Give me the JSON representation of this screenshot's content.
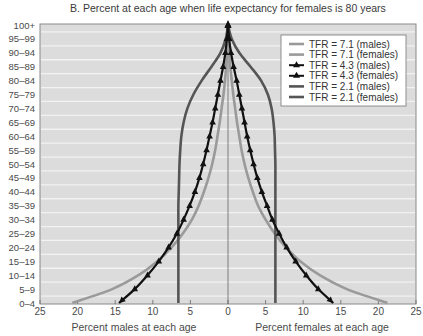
{
  "chart_data": {
    "type": "line",
    "title": "B. Percent at each age when life expectancy for females is 80 years",
    "xlabel_left": "Percent males at each age",
    "xlabel_right": "Percent females at each age",
    "ylabel": "",
    "x_tick_labels": [
      "25",
      "20",
      "15",
      "10",
      "5",
      "0",
      "5",
      "10",
      "15",
      "20",
      "25"
    ],
    "x_tick_values": [
      -25,
      -20,
      -15,
      -10,
      -5,
      0,
      5,
      10,
      15,
      20,
      25
    ],
    "xlim": [
      -25,
      25
    ],
    "categories": [
      "0–4",
      "5–9",
      "10–14",
      "15–19",
      "20–24",
      "25–29",
      "30–34",
      "35–39",
      "40–44",
      "45–49",
      "50–54",
      "55–59",
      "60–64",
      "65–69",
      "70–74",
      "75–79",
      "80–84",
      "85–89",
      "90–94",
      "95–99",
      "100+"
    ],
    "grid": true,
    "legend_position": "upper right",
    "series": [
      {
        "name": "TFR = 7.1 (males)",
        "side": "left",
        "color": "#9a9a9a",
        "marker": "none",
        "values": [
          20.7,
          15.4,
          11.9,
          9.4,
          7.5,
          6.0,
          4.8,
          3.9,
          3.2,
          2.6,
          2.1,
          1.7,
          1.4,
          1.1,
          0.85,
          0.6,
          0.4,
          0.25,
          0.1,
          0.05,
          0.0
        ]
      },
      {
        "name": "TFR = 7.1 (females)",
        "side": "right",
        "color": "#9a9a9a",
        "marker": "none",
        "values": [
          21.2,
          15.8,
          12.2,
          9.6,
          7.7,
          6.2,
          5.0,
          4.0,
          3.3,
          2.7,
          2.2,
          1.8,
          1.5,
          1.2,
          0.95,
          0.7,
          0.5,
          0.3,
          0.15,
          0.05,
          0.0
        ]
      },
      {
        "name": "TFR = 4.3 (males)",
        "side": "left",
        "color": "#111111",
        "marker": "triangle",
        "values": [
          14.5,
          12.4,
          10.7,
          9.2,
          7.9,
          6.8,
          5.9,
          5.1,
          4.4,
          3.8,
          3.3,
          2.85,
          2.45,
          2.05,
          1.7,
          1.35,
          1.0,
          0.65,
          0.35,
          0.15,
          0.0
        ]
      },
      {
        "name": "TFR = 4.3 (females)",
        "side": "right",
        "color": "#111111",
        "marker": "triangle",
        "values": [
          14.0,
          12.0,
          10.4,
          9.0,
          7.8,
          6.8,
          5.9,
          5.2,
          4.5,
          3.9,
          3.4,
          2.95,
          2.55,
          2.2,
          1.85,
          1.5,
          1.15,
          0.75,
          0.4,
          0.15,
          0.0
        ]
      },
      {
        "name": "TFR = 2.1 (males)",
        "side": "left",
        "color": "#555555",
        "marker": "none",
        "values": [
          6.6,
          6.6,
          6.6,
          6.6,
          6.6,
          6.6,
          6.6,
          6.6,
          6.55,
          6.5,
          6.45,
          6.35,
          6.2,
          5.9,
          5.4,
          4.6,
          3.5,
          2.2,
          1.0,
          0.3,
          0.0
        ]
      },
      {
        "name": "TFR = 2.1 (females)",
        "side": "right",
        "color": "#555555",
        "marker": "none",
        "values": [
          6.3,
          6.3,
          6.3,
          6.3,
          6.3,
          6.3,
          6.3,
          6.3,
          6.3,
          6.3,
          6.3,
          6.25,
          6.2,
          6.05,
          5.8,
          5.3,
          4.4,
          3.0,
          1.5,
          0.5,
          0.0
        ]
      }
    ]
  },
  "legend": {
    "items": [
      {
        "label": "TFR = 7.1 (males)"
      },
      {
        "label": "TFR = 7.1 (females)"
      },
      {
        "label": "TFR = 4.3 (males)"
      },
      {
        "label": "TFR = 4.3 (females)"
      },
      {
        "label": "TFR = 2.1 (males)"
      },
      {
        "label": "TFR = 2.1 (females)"
      }
    ]
  },
  "colors": {
    "plot_background": "#dcdcdc",
    "gridline": "#f2f2f2",
    "frame": "#8a8a8a"
  }
}
